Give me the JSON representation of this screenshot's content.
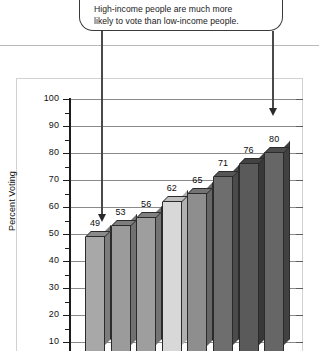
{
  "callout": {
    "name": "annotation-callout",
    "line1": "High-income people are much more",
    "line2": "likely to vote than low-income people."
  },
  "chart_data": {
    "type": "bar",
    "title": "",
    "subtitle": "",
    "xlabel": "",
    "ylabel": "Percent Voting",
    "ylim": [
      0,
      100
    ],
    "ytick_labels": [
      "100",
      "90",
      "80",
      "70",
      "60",
      "50",
      "40",
      "30",
      "20",
      "10"
    ],
    "yticks": [
      100,
      90,
      80,
      70,
      60,
      50,
      40,
      30,
      20,
      10
    ],
    "grid": true,
    "legend": "none",
    "categories": [
      "1",
      "2",
      "3",
      "4",
      "5",
      "6",
      "7",
      "8"
    ],
    "values": [
      49,
      53,
      56,
      62,
      65,
      71,
      76,
      80
    ],
    "value_labels": [
      "49",
      "53",
      "56",
      "62",
      "65",
      "71",
      "76",
      "80"
    ],
    "bar_colors": [
      "#a8a8a8",
      "#9b9b9b",
      "#9e9e9e",
      "#d8d8d8",
      "#8e8e8e",
      "#6e6e6e",
      "#5a5a5a",
      "#666666"
    ],
    "bar_top_colors": [
      "#8a8a8a",
      "#7e7e7e",
      "#818181",
      "#bdbdbd",
      "#737373",
      "#565656",
      "#434343",
      "#4d4d4d"
    ],
    "bar_side_colors": [
      "#7d7d7d",
      "#717171",
      "#747474",
      "#b0b0b0",
      "#666666",
      "#4a4a4a",
      "#383838",
      "#414141"
    ],
    "annotations": [
      "High-income people are much more likely to vote than low-income people."
    ]
  },
  "colors": {
    "axis": "#1c1c1c",
    "gridline": "#8a8a8a",
    "frame": "#d2d2d2",
    "divider": "#b9b9b9",
    "leader": "#4a4a4a",
    "text": "#111111"
  }
}
